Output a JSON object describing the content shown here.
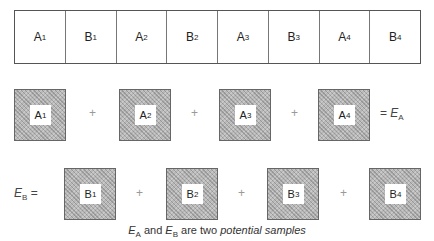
{
  "strip": {
    "cells": [
      {
        "letter": "A",
        "sub": "1"
      },
      {
        "letter": "B",
        "sub": "1"
      },
      {
        "letter": "A",
        "sub": "2"
      },
      {
        "letter": "B",
        "sub": "2"
      },
      {
        "letter": "A",
        "sub": "3"
      },
      {
        "letter": "B",
        "sub": "3"
      },
      {
        "letter": "A",
        "sub": "4"
      },
      {
        "letter": "B",
        "sub": "4"
      }
    ]
  },
  "row_a": {
    "boxes": [
      {
        "letter": "A",
        "sub": "1"
      },
      {
        "letter": "A",
        "sub": "2"
      },
      {
        "letter": "A",
        "sub": "3"
      },
      {
        "letter": "A",
        "sub": "4"
      }
    ],
    "operator": "+",
    "result": {
      "prefix": "= ",
      "letter": "E",
      "sub": "A"
    }
  },
  "row_b": {
    "label": {
      "letter": "E",
      "sub": "B",
      "suffix": " ="
    },
    "boxes": [
      {
        "letter": "B",
        "sub": "1"
      },
      {
        "letter": "B",
        "sub": "2"
      },
      {
        "letter": "B",
        "sub": "3"
      },
      {
        "letter": "B",
        "sub": "4"
      }
    ],
    "operator": "+"
  },
  "caption": {
    "ea_letter": "E",
    "ea_sub": "A",
    "and": " and ",
    "eb_letter": "E",
    "eb_sub": "B",
    "middle": " are two ",
    "emphasis": "potential samples"
  }
}
